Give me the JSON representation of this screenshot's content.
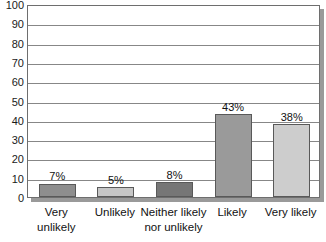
{
  "chart_data": {
    "type": "bar",
    "title": "",
    "subtitle": "",
    "xlabel": "",
    "ylabel": "",
    "ylim": [
      0,
      100
    ],
    "y_tick_step": 10,
    "grid": true,
    "legend": false,
    "categories": [
      "Very\nunlikely",
      "Unlikely",
      "Neither likely\nnor unlikely",
      "Likely",
      "Very likely"
    ],
    "values": [
      7,
      5,
      8,
      43,
      38
    ],
    "data_labels": [
      "7%",
      "5%",
      "8%",
      "43%",
      "38%"
    ],
    "bar_colors": [
      "#8e8e8e",
      "#c6c6c6",
      "#767676",
      "#9a9a9a",
      "#cdcdcd"
    ],
    "y_tick_labels": [
      "100",
      "90",
      "80",
      "70",
      "60",
      "50",
      "40",
      "30",
      "20",
      "10",
      "0"
    ]
  },
  "style": {
    "plot_border_color": "#6e6e6e",
    "gridline_color": "#878787",
    "shadow_color": "#9a9a9a",
    "bar_border_color": "#595959",
    "background": "#ffffff",
    "text_color": "#111111"
  }
}
